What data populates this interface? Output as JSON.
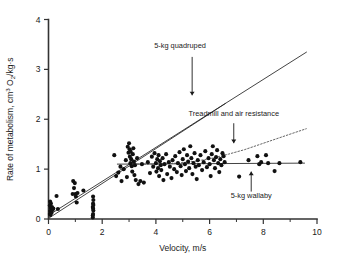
{
  "chart_data": {
    "type": "scatter",
    "title": "",
    "xlabel": "Velocity, m/s",
    "ylabel_parts": {
      "prefix": "Rate of metabolism, cm",
      "sup": "3",
      "mid": " O",
      "sub": "2",
      "suffix": "/kg·s"
    },
    "ylabel": "Rate of metabolism, cm3 O2/kg·s",
    "xlim": [
      0,
      10
    ],
    "ylim": [
      0,
      4
    ],
    "xticks": [
      0,
      2,
      4,
      6,
      8,
      10
    ],
    "xticklabels": [
      "0",
      "2",
      "4",
      "6",
      "8",
      "10"
    ],
    "xminor_ticks": [
      1,
      3,
      5,
      7,
      9
    ],
    "yticks": [
      0,
      1,
      2,
      3,
      4
    ],
    "yticklabels": [
      "0",
      "1",
      "2",
      "3",
      "4"
    ],
    "grid": false,
    "legend": "none",
    "annotations": [
      {
        "name": "quadruped-label",
        "text": "5-kg quadruped",
        "text_x": 4.9,
        "text_y": 3.42,
        "arrow_from": [
          5.35,
          3.25
        ],
        "arrow_to": [
          5.35,
          2.48
        ]
      },
      {
        "name": "treadmill-label",
        "text": "Treadmill and air resistance",
        "text_x": 6.9,
        "text_y": 2.07,
        "arrow_from": [
          6.9,
          1.92
        ],
        "arrow_to": [
          6.9,
          1.52
        ]
      },
      {
        "name": "wallaby-label",
        "text": "5-kg wallaby",
        "text_x": 7.55,
        "text_y": 0.42,
        "arrow_from": [
          7.55,
          0.55
        ],
        "arrow_to": [
          7.55,
          0.95
        ]
      }
    ],
    "series": [
      {
        "name": "5-kg quadruped",
        "style": "solid-line",
        "points": [
          [
            0.02,
            0.08
          ],
          [
            9.62,
            3.35
          ]
        ]
      },
      {
        "name": "regression-through-data",
        "style": "solid-line",
        "points": [
          [
            0.02,
            0.02
          ],
          [
            6.6,
            2.32
          ]
        ]
      },
      {
        "name": "5-kg wallaby",
        "style": "solid-line",
        "points": [
          [
            2.55,
            1.1
          ],
          [
            9.55,
            1.12
          ]
        ]
      },
      {
        "name": "Treadmill and air resistance",
        "style": "dotted-curve",
        "points": [
          [
            3.05,
            1.1
          ],
          [
            4.0,
            1.1
          ],
          [
            4.8,
            1.12
          ],
          [
            5.5,
            1.16
          ],
          [
            6.1,
            1.22
          ],
          [
            6.7,
            1.3
          ],
          [
            7.3,
            1.39
          ],
          [
            7.9,
            1.5
          ],
          [
            8.5,
            1.61
          ],
          [
            9.1,
            1.72
          ],
          [
            9.6,
            1.81
          ]
        ]
      }
    ],
    "scatter_points": [
      [
        0.05,
        0.1
      ],
      [
        0.06,
        0.16
      ],
      [
        0.08,
        0.22
      ],
      [
        0.05,
        0.27
      ],
      [
        0.1,
        0.14
      ],
      [
        0.12,
        0.19
      ],
      [
        0.09,
        0.31
      ],
      [
        0.07,
        0.08
      ],
      [
        0.13,
        0.24
      ],
      [
        0.11,
        0.12
      ],
      [
        0.15,
        0.18
      ],
      [
        0.06,
        0.35
      ],
      [
        0.18,
        0.21
      ],
      [
        0.3,
        0.46
      ],
      [
        0.35,
        0.2
      ],
      [
        0.95,
        0.62
      ],
      [
        0.98,
        0.72
      ],
      [
        1.0,
        0.5
      ],
      [
        1.02,
        0.45
      ],
      [
        1.05,
        0.33
      ],
      [
        0.92,
        0.76
      ],
      [
        1.08,
        0.52
      ],
      [
        0.9,
        0.5
      ],
      [
        1.65,
        0.03
      ],
      [
        1.66,
        0.1
      ],
      [
        1.67,
        0.17
      ],
      [
        1.65,
        0.24
      ],
      [
        1.66,
        0.31
      ],
      [
        1.67,
        0.38
      ],
      [
        1.66,
        0.45
      ],
      [
        1.65,
        0.07
      ],
      [
        1.66,
        0.21
      ],
      [
        1.67,
        0.28
      ],
      [
        1.3,
        0.57
      ],
      [
        2.45,
        1.28
      ],
      [
        2.52,
        0.86
      ],
      [
        2.6,
        0.93
      ],
      [
        2.68,
        1.05
      ],
      [
        2.72,
        0.76
      ],
      [
        2.8,
        1.0
      ],
      [
        2.88,
        1.18
      ],
      [
        2.92,
        0.84
      ],
      [
        2.95,
        1.45
      ],
      [
        2.98,
        1.33
      ],
      [
        3.0,
        1.52
      ],
      [
        3.02,
        1.4
      ],
      [
        3.03,
        1.25
      ],
      [
        3.05,
        1.12
      ],
      [
        3.06,
        1.35
      ],
      [
        3.08,
        1.2
      ],
      [
        3.1,
        1.06
      ],
      [
        3.12,
        0.95
      ],
      [
        3.14,
        1.3
      ],
      [
        3.16,
        1.42
      ],
      [
        3.18,
        1.15
      ],
      [
        3.2,
        0.88
      ],
      [
        3.22,
        1.08
      ],
      [
        3.25,
        0.78
      ],
      [
        3.3,
        1.22
      ],
      [
        3.35,
        0.7
      ],
      [
        3.42,
        0.76
      ],
      [
        3.48,
        1.1
      ],
      [
        3.55,
        0.73
      ],
      [
        3.7,
        1.14
      ],
      [
        3.78,
        0.92
      ],
      [
        3.85,
        1.25
      ],
      [
        3.9,
        1.05
      ],
      [
        3.95,
        1.32
      ],
      [
        4.0,
        1.12
      ],
      [
        4.02,
        0.95
      ],
      [
        4.05,
        1.2
      ],
      [
        4.08,
        1.02
      ],
      [
        4.1,
        1.28
      ],
      [
        4.12,
        0.86
      ],
      [
        4.15,
        1.16
      ],
      [
        4.18,
        1.08
      ],
      [
        4.2,
        0.98
      ],
      [
        4.25,
        1.22
      ],
      [
        4.28,
        0.78
      ],
      [
        4.32,
        1.1
      ],
      [
        4.38,
        1.3
      ],
      [
        4.42,
        0.9
      ],
      [
        4.48,
        1.14
      ],
      [
        4.52,
        1.05
      ],
      [
        4.58,
        0.82
      ],
      [
        4.62,
        1.18
      ],
      [
        4.68,
        1.0
      ],
      [
        4.72,
        1.26
      ],
      [
        4.78,
        0.94
      ],
      [
        4.82,
        1.12
      ],
      [
        4.88,
        1.34
      ],
      [
        4.92,
        1.06
      ],
      [
        4.96,
        0.88
      ],
      [
        5.0,
        1.2
      ],
      [
        5.04,
        1.4
      ],
      [
        5.08,
        1.1
      ],
      [
        5.12,
        0.96
      ],
      [
        5.16,
        1.28
      ],
      [
        5.2,
        1.15
      ],
      [
        5.24,
        1.02
      ],
      [
        5.28,
        1.46
      ],
      [
        5.32,
        1.22
      ],
      [
        5.36,
        0.9
      ],
      [
        5.4,
        1.12
      ],
      [
        5.44,
        1.32
      ],
      [
        5.48,
        1.05
      ],
      [
        5.52,
        0.8
      ],
      [
        5.56,
        1.18
      ],
      [
        5.6,
        1.08
      ],
      [
        5.66,
        1.28
      ],
      [
        5.72,
        0.98
      ],
      [
        5.78,
        1.14
      ],
      [
        5.84,
        1.36
      ],
      [
        5.9,
        1.04
      ],
      [
        5.96,
        1.22
      ],
      [
        6.0,
        1.1
      ],
      [
        6.04,
        0.86
      ],
      [
        6.08,
        1.3
      ],
      [
        6.12,
        1.46
      ],
      [
        6.16,
        1.18
      ],
      [
        6.2,
        1.02
      ],
      [
        6.24,
        1.24
      ],
      [
        6.28,
        1.38
      ],
      [
        6.32,
        1.12
      ],
      [
        6.36,
        0.94
      ],
      [
        6.4,
        1.2
      ],
      [
        6.44,
        1.08
      ],
      [
        6.48,
        1.32
      ],
      [
        6.52,
        1.26
      ],
      [
        6.56,
        1.14
      ],
      [
        7.1,
        0.85
      ],
      [
        7.45,
        1.18
      ],
      [
        7.78,
        1.26
      ],
      [
        7.85,
        1.1
      ],
      [
        7.92,
        1.14
      ],
      [
        8.1,
        1.28
      ],
      [
        8.18,
        1.12
      ],
      [
        8.42,
        0.96
      ],
      [
        8.6,
        1.12
      ],
      [
        9.38,
        1.14
      ]
    ]
  }
}
